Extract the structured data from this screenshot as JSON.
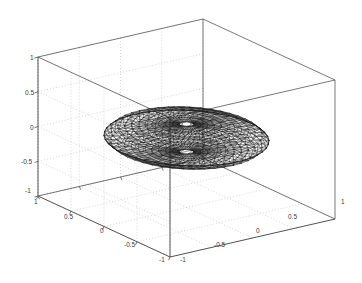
{
  "figure": {
    "kind": "matlab-3d-mesh-plot",
    "background_color": "#ffffff",
    "axes_color": "#555555",
    "grid_color": "#bbbbbb",
    "mesh_color": "#1a1a1a",
    "title": "",
    "width_px": 362,
    "height_px": 283
  },
  "chart_data": {
    "type": "line",
    "render": "3d-triangular-mesh-wireframe",
    "title": "",
    "xlabel": "",
    "ylabel": "",
    "zlabel": "",
    "grid": true,
    "legend": null,
    "legend_position": "none",
    "xlim": [
      -1,
      1
    ],
    "ylim": [
      -1,
      1
    ],
    "zlim": [
      -1,
      1
    ],
    "x_ticks": [
      -1,
      -0.5,
      0,
      0.5,
      1
    ],
    "y_ticks": [
      1,
      0.5,
      0,
      -0.5,
      -1
    ],
    "z_ticks": [
      -1,
      -0.5,
      0,
      0.5,
      1
    ],
    "x_tick_labels": [
      "-1",
      "-0.5",
      "0",
      "0.5",
      "1"
    ],
    "y_tick_labels": [
      "1",
      "0.5",
      "0",
      "-0.5",
      "-1"
    ],
    "z_tick_labels": [
      "-1",
      "-0.5",
      "0",
      "0.5",
      "1"
    ],
    "surface": {
      "description": "Oblate spheroid / flattened disk wireframe triangulation centered at origin",
      "center": [
        0,
        0,
        0
      ],
      "radius_x": 0.78,
      "radius_y": 0.78,
      "radius_z": 0.2,
      "center_hole_radius": 0.09,
      "n_radial_rings": 11,
      "n_angular_divisions": 44
    },
    "view": {
      "azimuth_deg": -37.5,
      "elevation_deg": 18,
      "projection": "orthographic",
      "box": true
    }
  },
  "ticks": {
    "z": [
      {
        "label": "1",
        "x": 30,
        "y": 60
      },
      {
        "label": "0.5",
        "x": 25,
        "y": 95
      },
      {
        "label": "0",
        "x": 30,
        "y": 130
      },
      {
        "label": "-0.5",
        "x": 21,
        "y": 164
      },
      {
        "label": "-1",
        "x": 25,
        "y": 193
      }
    ],
    "y": [
      {
        "label": "1",
        "x": 34,
        "y": 204
      },
      {
        "label": "0.5",
        "x": 64,
        "y": 219
      },
      {
        "label": "0",
        "x": 100,
        "y": 233
      },
      {
        "label": "-0.5",
        "x": 124,
        "y": 247
      },
      {
        "label": "-1",
        "x": 159,
        "y": 262
      }
    ],
    "x": [
      {
        "label": "-1",
        "x": 180,
        "y": 262
      },
      {
        "label": "-0.5",
        "x": 214,
        "y": 247
      },
      {
        "label": "0",
        "x": 256,
        "y": 233
      },
      {
        "label": "0.5",
        "x": 288,
        "y": 219
      },
      {
        "label": "1",
        "x": 341,
        "y": 204
      }
    ]
  }
}
